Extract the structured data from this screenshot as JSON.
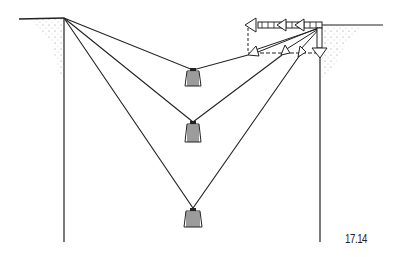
{
  "figure": {
    "label": "17.14",
    "weights": [
      {
        "name": "weight-top",
        "x": 193,
        "y": 77
      },
      {
        "name": "weight-middle",
        "x": 193,
        "y": 128
      },
      {
        "name": "weight-bottom",
        "x": 193,
        "y": 217
      }
    ],
    "colors": {
      "ink": "#222222",
      "background": "#ffffff"
    }
  }
}
